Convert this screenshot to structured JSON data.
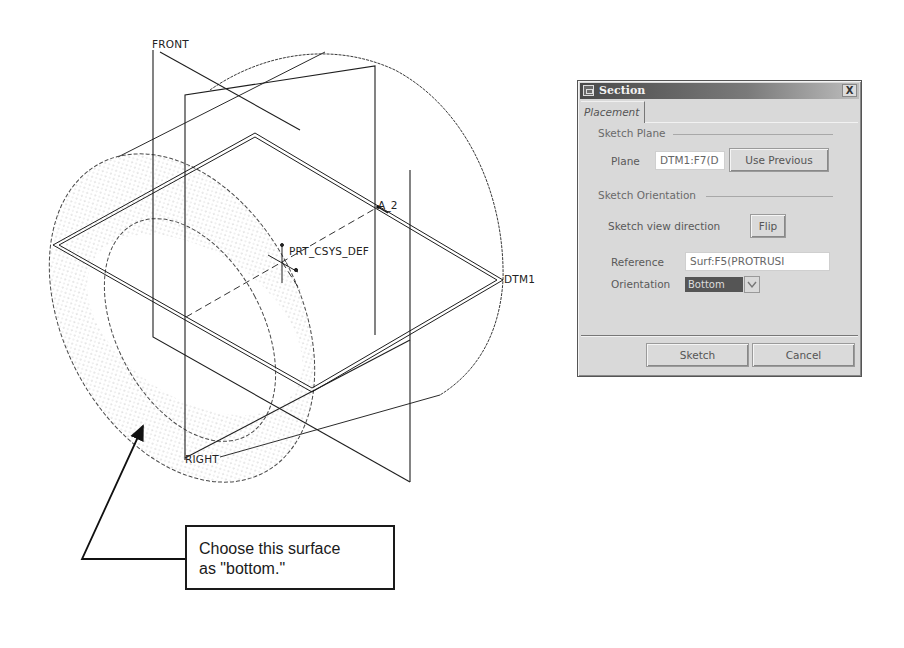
{
  "model_view": {
    "datum_labels": {
      "front": "FRONT",
      "right": "RIGHT",
      "dtm1": "DTM1",
      "axis": "A_2",
      "csys": "PRT_CSYS_DEF"
    },
    "colors": {
      "line": "#1e1e1e",
      "surface_dots": "#9a9a9a"
    }
  },
  "callout": {
    "line1": "Choose this surface",
    "line2": "as \"bottom.\""
  },
  "dialog": {
    "title": "Section",
    "close_label": "X",
    "tabs": [
      {
        "label": "Placement",
        "active": true
      }
    ],
    "sketch_plane": {
      "group_label": "Sketch Plane",
      "plane_label": "Plane",
      "plane_value": "DTM1:F7(D",
      "use_previous_label": "Use Previous"
    },
    "sketch_orientation": {
      "group_label": "Sketch Orientation",
      "view_direction_label": "Sketch view direction",
      "flip_label": "Flip",
      "reference_label": "Reference",
      "reference_value": "Surf:F5(PROTRUSI",
      "orientation_label": "Orientation",
      "orientation_value": "Bottom"
    },
    "footer": {
      "sketch_label": "Sketch",
      "cancel_label": "Cancel"
    }
  }
}
